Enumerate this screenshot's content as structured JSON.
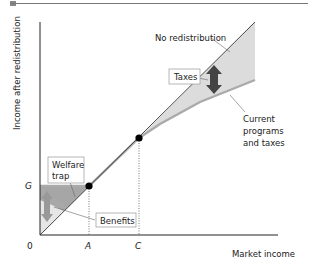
{
  "figure": {
    "y_axis_label": "Income after redistribution",
    "x_axis_label": "Market income",
    "origin_label": "0",
    "y_tick_label": "G",
    "x_tick_labels": [
      "A",
      "C"
    ],
    "curves": {
      "no_redistribution": "No redistribution",
      "current": [
        "Current",
        "programs",
        "and taxes"
      ]
    },
    "callouts": {
      "taxes": "Taxes",
      "benefits": "Benefits",
      "welfare_trap": [
        "Welfare",
        "trap"
      ]
    },
    "colors": {
      "curve_current": "#aaaaaa",
      "shade_light": "#dcdcdc",
      "shade_dark": "#a6a6a6",
      "arrow": "#444444",
      "point": "#000000",
      "axis": "#222222"
    }
  }
}
